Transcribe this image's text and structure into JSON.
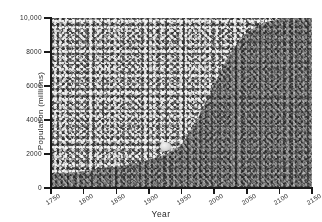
{
  "chart_data": {
    "type": "area",
    "title": "",
    "xlabel": "Year",
    "ylabel": "Population (millions)",
    "xlim": [
      1750,
      2150
    ],
    "ylim": [
      0,
      10000
    ],
    "xticks": [
      "1750",
      "1800",
      "1850",
      "1900",
      "1950",
      "2000",
      "2050",
      "2100",
      "2150"
    ],
    "yticks": [
      "0",
      "2000",
      "4000",
      "6000",
      "8000",
      "10,000"
    ],
    "grid": false,
    "legend": null,
    "series": [
      {
        "name": "World population",
        "x": [
          1750,
          1775,
          1800,
          1825,
          1850,
          1875,
          1900,
          1925,
          1950,
          1975,
          2000,
          2025,
          2050,
          2075,
          2100,
          2125,
          2150
        ],
        "values": [
          790,
          880,
          980,
          1100,
          1260,
          1420,
          1650,
          1950,
          2520,
          4070,
          6070,
          8000,
          9150,
          9700,
          9950,
          10000,
          10000
        ]
      }
    ],
    "annotations": [
      {
        "name": "light-speckle-artifact",
        "x": 1925,
        "y": 2450
      }
    ]
  },
  "colors": {
    "field_light": "#9d9d9d",
    "field_dark": "#6f6f6f",
    "axis": "#1a1a1a",
    "text": "#1f1f1f",
    "background": "#ffffff"
  }
}
